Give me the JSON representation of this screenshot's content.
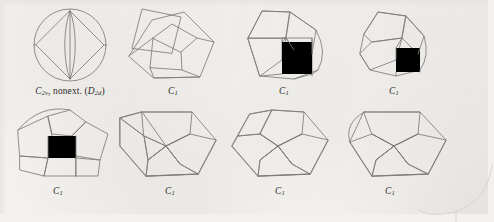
{
  "plate": {
    "background_color": "#f3f1ed",
    "stroke_color": "#7e7c7b",
    "text_color": "#2e2c2b",
    "rows": 2,
    "columns": 4,
    "total_figures": 8
  },
  "figures": [
    {
      "index": 1,
      "name": "schlegel-diagram-1",
      "row": 1,
      "column": 1,
      "caption": {
        "point_group": "C",
        "point_group_sub": "2v",
        "note": ", nonext. (",
        "alt_group": "D",
        "alt_group_sub": "2d",
        "close": ")",
        "full_text": "C2v, nonext. (D2d)"
      },
      "description": "circle with inscribed rhombus and vertical lens"
    },
    {
      "index": 2,
      "name": "schlegel-diagram-2",
      "row": 1,
      "column": 2,
      "caption": {
        "point_group": "C",
        "point_group_sub": "1",
        "note": "",
        "alt_group": "",
        "alt_group_sub": "",
        "close": "",
        "full_text": "C1"
      },
      "description": "pentagon with inner quadrilateral cells and overlapping square"
    },
    {
      "index": 3,
      "name": "schlegel-diagram-3",
      "row": 1,
      "column": 3,
      "caption": {
        "point_group": "C",
        "point_group_sub": "1",
        "note": "",
        "alt_group": "",
        "alt_group_sub": "",
        "close": "",
        "full_text": "C1"
      },
      "description": "pentagon with inner pentagon, square and curved right edge"
    },
    {
      "index": 4,
      "name": "schlegel-diagram-4",
      "row": 1,
      "column": 4,
      "caption": {
        "point_group": "C",
        "point_group_sub": "1",
        "note": "",
        "alt_group": "",
        "alt_group_sub": "",
        "close": "",
        "full_text": "C1"
      },
      "description": "tilted polygon with inner square and curved right edge"
    },
    {
      "index": 5,
      "name": "schlegel-diagram-5",
      "row": 2,
      "column": 1,
      "caption": {
        "point_group": "C",
        "point_group_sub": "1",
        "note": "",
        "alt_group": "",
        "alt_group_sub": "",
        "close": "",
        "full_text": "C1"
      },
      "description": "fan of quadrilaterals around a central square with arc top"
    },
    {
      "index": 6,
      "name": "schlegel-diagram-6",
      "row": 2,
      "column": 2,
      "caption": {
        "point_group": "C",
        "point_group_sub": "1",
        "note": "",
        "alt_group": "",
        "alt_group_sub": "",
        "close": "",
        "full_text": "C1"
      },
      "description": "heptagonal outline with three pentagonal cells"
    },
    {
      "index": 7,
      "name": "schlegel-diagram-7",
      "row": 2,
      "column": 3,
      "caption": {
        "point_group": "C",
        "point_group_sub": "1",
        "note": "",
        "alt_group": "",
        "alt_group_sub": "",
        "close": "",
        "full_text": "C1"
      },
      "description": "heptagonal outline with three pentagonal cells variant"
    },
    {
      "index": 8,
      "name": "schlegel-diagram-8",
      "row": 2,
      "column": 4,
      "caption": {
        "point_group": "C",
        "point_group_sub": "1",
        "note": "",
        "alt_group": "",
        "alt_group_sub": "",
        "close": "",
        "full_text": "C1"
      },
      "description": "heptagonal outline with three pentagonal cells and arc left edge"
    }
  ]
}
